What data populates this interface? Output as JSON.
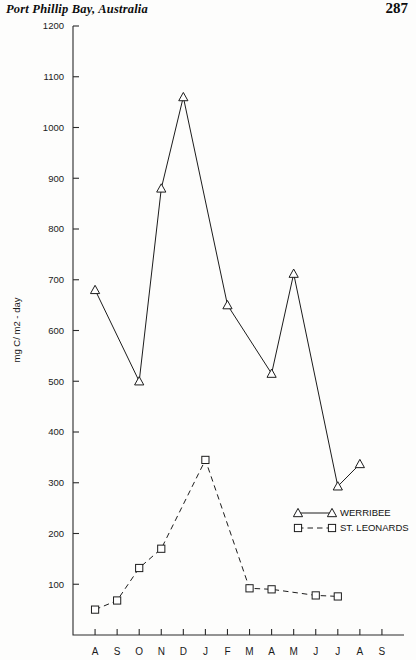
{
  "header": {
    "book_title": "Port Phillip Bay, Australia",
    "page_number": "287"
  },
  "legend": {
    "position": "inside-right",
    "entries": [
      {
        "label": "WERRIBEE",
        "marker": "triangle-icon",
        "line": "solid"
      },
      {
        "label": "ST. LEONARDS",
        "marker": "square-icon",
        "line": "dashed"
      }
    ]
  },
  "chart_data": {
    "type": "line",
    "title": "",
    "subtitle": "",
    "xlabel": "",
    "ylabel": "mg C/ m2 - day",
    "ylim": [
      0,
      1200
    ],
    "xlim": [
      0,
      15
    ],
    "grid": false,
    "legend_position": "inside-right",
    "categories": [
      "A",
      "S",
      "O",
      "N",
      "D",
      "J",
      "F",
      "M",
      "A",
      "M",
      "J",
      "J",
      "A",
      "S"
    ],
    "ytick_labels": [
      "1200",
      "1100",
      "1000",
      "900",
      "800",
      "700",
      "600",
      "500",
      "400",
      "300",
      "200",
      "100"
    ],
    "ytick_values": [
      1200,
      1100,
      1000,
      900,
      800,
      700,
      600,
      500,
      400,
      300,
      200,
      100
    ],
    "series": [
      {
        "name": "WERRIBEE",
        "marker": "triangle",
        "line": "solid",
        "x": [
          "A",
          "S",
          "O",
          "N",
          "D",
          "J",
          "F",
          "M",
          "A",
          "M",
          "J",
          "J",
          "A"
        ],
        "values": [
          680,
          null,
          500,
          880,
          1060,
          null,
          650,
          null,
          515,
          712,
          null,
          293,
          337
        ]
      },
      {
        "name": "ST. LEONARDS",
        "marker": "square",
        "line": "dashed",
        "x": [
          "A",
          "S",
          "O",
          "N",
          "D",
          "J",
          "F",
          "M",
          "A",
          "M",
          "J",
          "J",
          "A"
        ],
        "values": [
          50,
          68,
          132,
          170,
          null,
          345,
          null,
          92,
          90,
          null,
          78,
          76,
          null
        ]
      }
    ]
  }
}
